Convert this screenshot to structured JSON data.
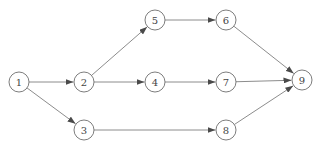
{
  "diagram": {
    "type": "directed-network",
    "node_radius": 10,
    "colors": {
      "stroke": "#6e6e6e",
      "text": "#444444",
      "background": "#ffffff"
    },
    "nodes": [
      {
        "id": "1",
        "label": "1",
        "x": 19,
        "y": 82
      },
      {
        "id": "2",
        "label": "2",
        "x": 84,
        "y": 82
      },
      {
        "id": "3",
        "label": "3",
        "x": 84,
        "y": 130
      },
      {
        "id": "4",
        "label": "4",
        "x": 155,
        "y": 82
      },
      {
        "id": "5",
        "label": "5",
        "x": 155,
        "y": 20
      },
      {
        "id": "6",
        "label": "6",
        "x": 226,
        "y": 20
      },
      {
        "id": "7",
        "label": "7",
        "x": 226,
        "y": 82
      },
      {
        "id": "8",
        "label": "8",
        "x": 226,
        "y": 130
      },
      {
        "id": "9",
        "label": "9",
        "x": 302,
        "y": 80
      }
    ],
    "edges": [
      {
        "from": "1",
        "to": "2"
      },
      {
        "from": "1",
        "to": "3"
      },
      {
        "from": "2",
        "to": "5"
      },
      {
        "from": "2",
        "to": "4"
      },
      {
        "from": "5",
        "to": "6"
      },
      {
        "from": "4",
        "to": "7"
      },
      {
        "from": "3",
        "to": "8"
      },
      {
        "from": "6",
        "to": "9"
      },
      {
        "from": "7",
        "to": "9"
      },
      {
        "from": "8",
        "to": "9"
      }
    ]
  }
}
